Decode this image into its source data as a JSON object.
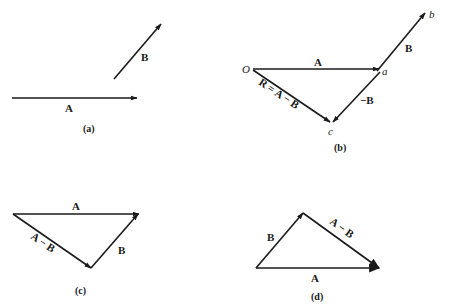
{
  "figure": {
    "panels": [
      {
        "id": "a",
        "caption": "(a)",
        "vectors": [
          {
            "name": "A",
            "label": "A",
            "from": [
              12,
              98
            ],
            "to": [
              137,
              98
            ]
          },
          {
            "name": "B",
            "label": "B",
            "from": [
              114,
              79
            ],
            "to": [
              161,
              24
            ]
          }
        ]
      },
      {
        "id": "b",
        "caption": "(b)",
        "points": {
          "O": "O",
          "a": "a",
          "b": "b",
          "c": "c"
        },
        "vectors": [
          {
            "name": "A",
            "label": "A",
            "from": [
              253,
              69
            ],
            "to": [
              379,
              69
            ]
          },
          {
            "name": "B",
            "label": "B",
            "from": [
              377,
              71
            ],
            "to": [
              425,
              13
            ]
          },
          {
            "name": "neg-B",
            "label": "−B",
            "from": [
              380,
              72
            ],
            "to": [
              333,
              122
            ]
          },
          {
            "name": "R",
            "label": "R = A − B",
            "from": [
              253,
              70
            ],
            "to": [
              330,
              122
            ]
          }
        ]
      },
      {
        "id": "c",
        "caption": "(c)",
        "vectors": [
          {
            "name": "A",
            "label": "A",
            "from": [
              13,
              214
            ],
            "to": [
              139,
              214
            ]
          },
          {
            "name": "A-minus-B",
            "label": "A − B",
            "from": [
              13,
              214
            ],
            "to": [
              91,
              268
            ]
          },
          {
            "name": "B",
            "label": "B",
            "from": [
              91,
              268
            ],
            "to": [
              138,
              214
            ]
          }
        ]
      },
      {
        "id": "d",
        "caption": "(d)",
        "vectors": [
          {
            "name": "B",
            "label": "B",
            "from": [
              256,
              268
            ],
            "to": [
              303,
              213
            ]
          },
          {
            "name": "A-minus-B",
            "label": "A − B",
            "from": [
              303,
              213
            ],
            "to": [
              379,
              268
            ]
          },
          {
            "name": "A",
            "label": "A",
            "from": [
              256,
              268
            ],
            "to": [
              379,
              268
            ]
          }
        ]
      }
    ]
  },
  "labels": {
    "a_A": "A",
    "a_B": "B",
    "a_cap": "(a)",
    "b_O": "O",
    "b_A": "A",
    "b_a": "a",
    "b_b": "b",
    "b_B": "B",
    "b_negB": "−B",
    "b_R": "R = A − B",
    "b_c": "c",
    "b_cap": "(b)",
    "c_A": "A",
    "c_AmB": "A − B",
    "c_B": "B",
    "c_cap": "(c)",
    "d_B": "B",
    "d_AmB": "A − B",
    "d_A": "A",
    "d_cap": "(d)"
  },
  "colors": {
    "ink": "#1a1a1a",
    "background": "#ffffff"
  }
}
